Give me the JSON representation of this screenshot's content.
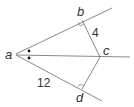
{
  "diagram": {
    "type": "geometry-angle-bisector",
    "points": {
      "a": {
        "label": "a",
        "x": 16,
        "y": 54
      },
      "b": {
        "label": "b",
        "x": 82,
        "y": 20
      },
      "c": {
        "label": "c",
        "x": 100,
        "y": 57
      },
      "d": {
        "label": "d",
        "x": 82,
        "y": 89
      }
    },
    "segments": [
      {
        "from": "b",
        "to": "c",
        "length_label": "4"
      },
      {
        "from": "a",
        "to": "d",
        "length_label": "12"
      },
      {
        "from": "c",
        "to": "d",
        "length_label": ""
      }
    ],
    "rays": [
      "a through b",
      "a through c",
      "a through d"
    ],
    "right_angles": [
      "at b",
      "at d"
    ],
    "congruent_angle_marks": "single dot at each half of angle a",
    "labels": {
      "a": "a",
      "b": "b",
      "c": "c",
      "d": "d",
      "bc": "4",
      "ad": "12"
    },
    "colors": {
      "line": "#888888",
      "text": "#333333",
      "dot": "#111111"
    }
  }
}
